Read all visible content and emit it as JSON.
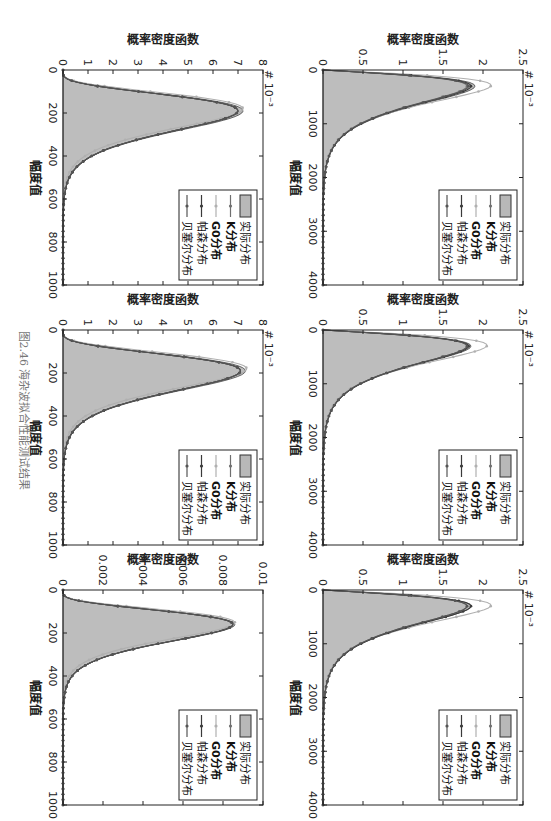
{
  "caption": "图2.46  海杂波拟合性能测试结果",
  "legend": {
    "items": [
      {
        "label": "实际分布",
        "type": "fill",
        "color": "#b8b8b8",
        "bold": false
      },
      {
        "label": "K分布",
        "type": "line",
        "color": "#6f6f6f",
        "bold": true
      },
      {
        "label": "G0分布",
        "type": "line",
        "color": "#b0b0b0",
        "bold": true
      },
      {
        "label": "帕森分布",
        "type": "line",
        "color": "#3a3a3a",
        "bold": false
      },
      {
        "label": "贝塞尔分布",
        "type": "line",
        "color": "#555555",
        "bold": false
      }
    ]
  },
  "axis_labels": {
    "x": "幅度值",
    "y": "概率密度函数"
  },
  "chart_data": [
    {
      "type": "area",
      "position": "row1-col1",
      "title": "",
      "xlabel": "幅度值",
      "ylabel": "概率密度函数",
      "xlim": [
        0,
        4000
      ],
      "ylim": [
        0,
        0.0025
      ],
      "y_multiplier": "× 10^-3",
      "xticks": [
        "1000",
        "2000",
        "3000",
        "4000"
      ],
      "yticks": [
        "0",
        "0.5",
        "1",
        "1.5",
        "2",
        "2.5"
      ],
      "peak_x": 300,
      "series": [
        {
          "name": "实际分布",
          "peak": 1.9
        },
        {
          "name": "K分布",
          "peak": 1.8
        },
        {
          "name": "G0分布",
          "peak": 2.1
        },
        {
          "name": "帕森分布",
          "peak": 1.85
        },
        {
          "name": "贝塞尔分布",
          "peak": 1.82
        }
      ],
      "tail_end_x": 1600
    },
    {
      "type": "area",
      "position": "row1-col2",
      "title": "",
      "xlabel": "幅度值",
      "ylabel": "概率密度函数",
      "xlim": [
        0,
        4000
      ],
      "ylim": [
        0,
        0.0025
      ],
      "y_multiplier": "× 10^-3",
      "xticks": [
        "1000",
        "2000",
        "3000",
        "4000"
      ],
      "yticks": [
        "0",
        "0.5",
        "1",
        "1.5",
        "2",
        "2.5"
      ],
      "peak_x": 300,
      "series": [
        {
          "name": "实际分布",
          "peak": 1.85
        },
        {
          "name": "K分布",
          "peak": 1.8
        },
        {
          "name": "G0分布",
          "peak": 2.05
        },
        {
          "name": "帕森分布",
          "peak": 1.82
        },
        {
          "name": "贝塞尔分布",
          "peak": 1.8
        }
      ],
      "tail_end_x": 1500
    },
    {
      "type": "area",
      "position": "row1-col3",
      "title": "",
      "xlabel": "幅度值",
      "ylabel": "概率密度函数",
      "xlim": [
        0,
        4000
      ],
      "ylim": [
        0,
        0.0025
      ],
      "y_multiplier": "× 10^-3",
      "xticks": [
        "1000",
        "2000",
        "3000",
        "4000"
      ],
      "yticks": [
        "0",
        "0.5",
        "1",
        "1.5",
        "2",
        "2.5"
      ],
      "peak_x": 300,
      "series": [
        {
          "name": "实际分布",
          "peak": 1.85
        },
        {
          "name": "K分布",
          "peak": 1.8
        },
        {
          "name": "G0分布",
          "peak": 2.1
        },
        {
          "name": "帕森分布",
          "peak": 1.85
        },
        {
          "name": "贝塞尔分布",
          "peak": 1.8
        }
      ],
      "tail_end_x": 1500
    },
    {
      "type": "area",
      "position": "row2-col1",
      "title": "",
      "xlabel": "幅度值",
      "ylabel": "概率密度函数",
      "xlim": [
        0,
        1000
      ],
      "ylim": [
        0,
        0.008
      ],
      "y_multiplier": "× 10^-3",
      "xticks": [
        "200",
        "400",
        "600",
        "800",
        "1000"
      ],
      "yticks": [
        "0",
        "1",
        "2",
        "3",
        "4",
        "5",
        "6",
        "7",
        "8"
      ],
      "peak_x": 190,
      "series": [
        {
          "name": "实际分布",
          "peak": 7.2
        },
        {
          "name": "K分布",
          "peak": 7.0
        },
        {
          "name": "G0分布",
          "peak": 7.2
        },
        {
          "name": "帕森分布",
          "peak": 7.0
        },
        {
          "name": "贝塞尔分布",
          "peak": 7.0
        }
      ],
      "tail_end_x": 420
    },
    {
      "type": "area",
      "position": "row2-col2",
      "title": "",
      "xlabel": "幅度值",
      "ylabel": "概率密度函数",
      "xlim": [
        0,
        1000
      ],
      "ylim": [
        0,
        0.008
      ],
      "y_multiplier": "× 10^-3",
      "xticks": [
        "200",
        "400",
        "600",
        "800",
        "1000"
      ],
      "yticks": [
        "0",
        "1",
        "2",
        "3",
        "4",
        "5",
        "6",
        "7",
        "8"
      ],
      "peak_x": 190,
      "series": [
        {
          "name": "实际分布",
          "peak": 7.3
        },
        {
          "name": "K分布",
          "peak": 7.1
        },
        {
          "name": "G0分布",
          "peak": 7.35
        },
        {
          "name": "帕森分布",
          "peak": 7.1
        },
        {
          "name": "贝塞尔分布",
          "peak": 7.1
        }
      ],
      "tail_end_x": 450
    },
    {
      "type": "area",
      "position": "row2-col3",
      "title": "",
      "xlabel": "幅度值",
      "ylabel": "概率密度函数",
      "xlim": [
        0,
        1000
      ],
      "ylim": [
        0,
        0.01
      ],
      "y_multiplier": "",
      "xticks": [
        "200",
        "400",
        "600",
        "800",
        "1000"
      ],
      "yticks": [
        "0",
        "0.002",
        "0.004",
        "0.006",
        "0.008",
        "0.01"
      ],
      "peak_x": 160,
      "series": [
        {
          "name": "实际分布",
          "peak": 0.0086
        },
        {
          "name": "K分布",
          "peak": 0.0085
        },
        {
          "name": "G0分布",
          "peak": 0.0086
        },
        {
          "name": "帕森分布",
          "peak": 0.0085
        },
        {
          "name": "贝塞尔分布",
          "peak": 0.0085
        }
      ],
      "tail_end_x": 350
    }
  ]
}
